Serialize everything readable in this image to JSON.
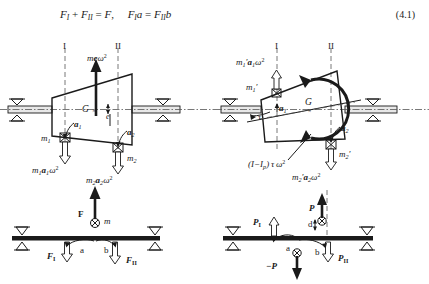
{
  "equation": {
    "number": "(4.1)",
    "text": "F_I + F_II = F,   F_I a = F_II b",
    "terms": {
      "F": "F",
      "F_I": "F",
      "F_II": "F",
      "sub_I": "I",
      "sub_II": "II",
      "a": "a",
      "b": "b",
      "plus": "+",
      "eq": "=",
      "comma": ","
    }
  },
  "figure": {
    "caption": "Static and couple (moment) unbalance of a rigid rotor and their equivalent two-plane correction forces",
    "panels": [
      {
        "id": "top-left",
        "name": "static-unbalance-rotor"
      },
      {
        "id": "top-right",
        "name": "couple-unbalance-rotor"
      },
      {
        "id": "bottom-left",
        "name": "static-unbalance-beam"
      },
      {
        "id": "bottom-right",
        "name": "couple-unbalance-beam"
      }
    ]
  },
  "panel_tl": {
    "plane_I": "I",
    "plane_II": "II",
    "force_main": {
      "m": "m",
      "e": "e",
      "omega": "ω",
      "exp": "2"
    },
    "cg": "G",
    "cg_mark": "×",
    "ecc": "e",
    "m1": "m",
    "m1_sub": "1",
    "m2": "m",
    "m2_sub": "2",
    "a1": "a",
    "a1_sub": "1",
    "a2": "a",
    "a2_sub": "2",
    "force1": {
      "m": "m",
      "msub": "1",
      "a": "a",
      "asub": "1",
      "omega": "ω",
      "exp": "2"
    },
    "force2": {
      "m": "m",
      "msub": "2",
      "a": "a",
      "asub": "2",
      "omega": "ω",
      "exp": "2"
    }
  },
  "panel_tr": {
    "plane_I": "I",
    "plane_II": "II",
    "cg": "G",
    "tau": "τ",
    "m1p": {
      "m": "m",
      "sub": "1",
      "prime": "′"
    },
    "m2p": {
      "m": "m",
      "sub": "2",
      "prime": "′"
    },
    "a1": "a",
    "a1_sub": "1",
    "a2": "a",
    "a2_sub": "2",
    "force1": {
      "m": "m",
      "msub": "1",
      "prime": "′",
      "a": "a",
      "asub": "1",
      "omega": "ω",
      "exp": "2"
    },
    "force2": {
      "m": "m",
      "msub": "2",
      "prime": "′",
      "a": "a",
      "asub": "2",
      "omega": "ω",
      "exp": "2"
    },
    "moment": {
      "open": "(",
      "I": "I",
      "minus": "−",
      "Ip": "I",
      "ipsub": "p",
      "close": ")",
      "tau": "τ",
      "omega": "ω",
      "exp": "2"
    }
  },
  "panel_bl": {
    "F": "F",
    "m": "m",
    "a": "a",
    "b": "b",
    "F_I": "F",
    "F_I_sub": "I",
    "F_II": "F",
    "F_II_sub": "II"
  },
  "panel_br": {
    "P": "P",
    "negP": "−P",
    "d": "d",
    "a": "a",
    "b": "b",
    "P_I": "P",
    "P_I_sub": "I",
    "P_II": "P",
    "P_II_sub": "II"
  },
  "colors": {
    "ink": "#1a1a1a",
    "background": "#ffffff",
    "dash": "#555555",
    "shaft_fill": "#e8e8e8"
  }
}
